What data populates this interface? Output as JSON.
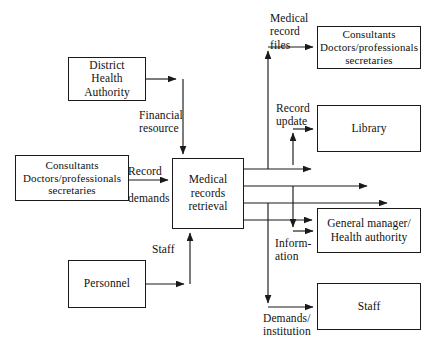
{
  "diagram": {
    "stroke_color": "#1a1a1a",
    "background_color": "#ffffff",
    "text_color": "#111111",
    "nodes": [
      {
        "id": "district-health-authority",
        "label": "District\nHealth\nAuthority"
      },
      {
        "id": "consultants-left",
        "label": "Consultants\nDoctors/professionals\nsecretaries"
      },
      {
        "id": "personnel",
        "label": "Personnel"
      },
      {
        "id": "medical-records-retrieval",
        "label": "Medical\nrecords\nretrieval"
      },
      {
        "id": "consultants-right",
        "label": "Consultants\nDoctors/professionals\nsecretaries"
      },
      {
        "id": "library",
        "label": "Library"
      },
      {
        "id": "general-manager",
        "label": "General manager/\nHealth authority"
      },
      {
        "id": "staff",
        "label": "Staff"
      }
    ],
    "edges": [
      {
        "id": "financial-resource",
        "from": "district-health-authority",
        "to": "medical-records-retrieval",
        "label": "Financial\nresource"
      },
      {
        "id": "record-demands",
        "from": "consultants-left",
        "to": "medical-records-retrieval",
        "label": "Record\n\ndemands"
      },
      {
        "id": "staff-input",
        "from": "personnel",
        "to": "medical-records-retrieval",
        "label": "Staff"
      },
      {
        "id": "medical-record-files",
        "from": "medical-records-retrieval",
        "to": "consultants-right",
        "label": "Medical\nrecord\nfiles"
      },
      {
        "id": "record-update",
        "from": "medical-records-retrieval",
        "to": "library",
        "label": "Record\nupdate"
      },
      {
        "id": "information",
        "from": "medical-records-retrieval",
        "to": "general-manager",
        "label": "Inform-\nation"
      },
      {
        "id": "demands-institution",
        "from": "medical-records-retrieval",
        "to": "staff",
        "label": "Demands/\ninstitution"
      }
    ]
  }
}
